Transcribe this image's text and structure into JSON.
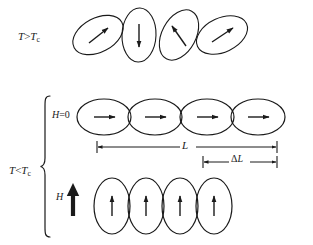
{
  "figure": {
    "background_color": "#ffffff",
    "stroke_color": "#1a1a1a",
    "labels": {
      "t_gt_tc": {
        "symbol": "T",
        "operator": ">",
        "symbol2": "T",
        "subscript": "c",
        "text": "T>Tc"
      },
      "t_lt_tc": {
        "symbol": "T",
        "operator": "<",
        "symbol2": "T",
        "subscript": "c",
        "text": "T<Tc"
      },
      "h_zero": {
        "symbol": "H",
        "operator": "=",
        "value": "0",
        "text": "H=0"
      },
      "h_field": {
        "symbol": "H",
        "text": "H"
      },
      "length_L": {
        "symbol": "L",
        "text": "L"
      },
      "delta_L": {
        "delta": "Δ",
        "symbol": "L",
        "text": "ΔL"
      }
    },
    "rows": {
      "disordered": {
        "name": "T greater than Tc - randomly oriented domains",
        "ellipse_count": 4,
        "ellipses": [
          {
            "cx": 98,
            "cy": 35,
            "rx": 27,
            "ry": 17,
            "rotate": -28,
            "arrow_angle": -30
          },
          {
            "cx": 139,
            "cy": 35,
            "rx": 27,
            "ry": 17,
            "rotate": -88,
            "arrow_angle": 90
          },
          {
            "cx": 179,
            "cy": 35,
            "rx": 27,
            "ry": 17,
            "rotate": -62,
            "arrow_angle": -145
          },
          {
            "cx": 222,
            "cy": 35,
            "rx": 27,
            "ry": 17,
            "rotate": -25,
            "arrow_angle": -25
          }
        ]
      },
      "aligned_no_field": {
        "name": "H equals 0 - elongated domains aligned horizontally",
        "ellipse_count": 4,
        "ellipses": [
          {
            "cx": 104,
            "cy": 117,
            "rx": 27,
            "ry": 18,
            "rotate": 0,
            "arrow_angle": 0
          },
          {
            "cx": 155,
            "cy": 117,
            "rx": 27,
            "ry": 18,
            "rotate": 0,
            "arrow_angle": 0
          },
          {
            "cx": 207,
            "cy": 117,
            "rx": 27,
            "ry": 18,
            "rotate": 0,
            "arrow_angle": 0
          },
          {
            "cx": 258,
            "cy": 117,
            "rx": 27,
            "ry": 18,
            "rotate": 0,
            "arrow_angle": 0
          }
        ]
      },
      "aligned_with_field": {
        "name": "H applied - domains rotated vertical, chain contracted",
        "ellipse_count": 4,
        "ellipses": [
          {
            "cx": 112,
            "cy": 206,
            "rx": 18,
            "ry": 28,
            "rotate": 0,
            "arrow_angle": -90
          },
          {
            "cx": 146,
            "cy": 206,
            "rx": 18,
            "ry": 28,
            "rotate": 0,
            "arrow_angle": -90
          },
          {
            "cx": 180,
            "cy": 206,
            "rx": 18,
            "ry": 28,
            "rotate": 0,
            "arrow_angle": -90
          },
          {
            "cx": 214,
            "cy": 206,
            "rx": 18,
            "ry": 28,
            "rotate": 0,
            "arrow_angle": -90
          }
        ]
      }
    },
    "dimension_bars": {
      "L": {
        "x1": 97,
        "x2": 277,
        "y": 147,
        "label": "L"
      },
      "delta_L": {
        "x1": 203,
        "x2": 277,
        "y": 162,
        "label": "ΔL"
      }
    },
    "brace": {
      "x": 45,
      "y_top": 95,
      "y_bottom": 237,
      "orientation": "left-curly"
    },
    "field_arrow": {
      "x": 73,
      "y_tail": 216,
      "y_head": 185,
      "style": "thick-solid-up"
    }
  }
}
